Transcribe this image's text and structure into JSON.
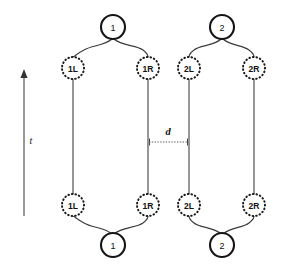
{
  "figure": {
    "type": "worldline-diagram",
    "background_color": "#ffffff",
    "line_color": "#4a4a4a",
    "node_stroke_color": "#151515",
    "text_color": "#111111"
  },
  "axis": {
    "name": "time-axis",
    "label": "t",
    "direction": "up",
    "x": 24,
    "y_top": 72,
    "y_bottom": 216,
    "label_x": 31,
    "label_y": 140
  },
  "dimension": {
    "name": "separation-d",
    "label": "d",
    "x_start": 148,
    "x_end": 189,
    "y": 142,
    "label_x": 168,
    "label_y": 131
  },
  "groups": [
    {
      "id": "group-1",
      "vertex_label": "1",
      "vertex_top": {
        "cx": 113,
        "cy": 27,
        "r": 12
      },
      "vertex_bottom": {
        "cx": 113,
        "cy": 245,
        "r": 12
      },
      "left": {
        "label": "1L",
        "x": 73,
        "top_cy": 68,
        "bottom_cy": 205,
        "r": 11
      },
      "right": {
        "label": "1R",
        "x": 148,
        "top_cy": 68,
        "bottom_cy": 205,
        "r": 11
      }
    },
    {
      "id": "group-2",
      "vertex_label": "2",
      "vertex_top": {
        "cx": 222,
        "cy": 27,
        "r": 12
      },
      "vertex_bottom": {
        "cx": 222,
        "cy": 245,
        "r": 12
      },
      "left": {
        "label": "2L",
        "x": 189,
        "top_cy": 68,
        "bottom_cy": 205,
        "r": 11
      },
      "right": {
        "label": "2R",
        "x": 254,
        "top_cy": 68,
        "bottom_cy": 205,
        "r": 11
      }
    }
  ]
}
